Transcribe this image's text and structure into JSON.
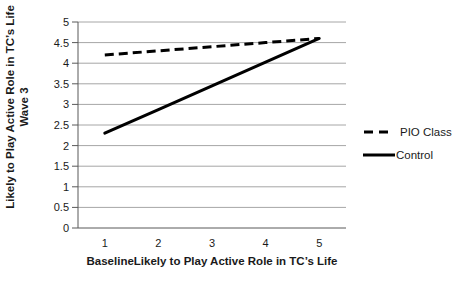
{
  "chart_data": {
    "type": "line",
    "title": "",
    "x": [
      1,
      2,
      3,
      4,
      5
    ],
    "xticks": [
      "1",
      "2",
      "3",
      "4",
      "5"
    ],
    "series": [
      {
        "name": "PIO Class",
        "style": "dashed",
        "color": "#000000",
        "values": [
          4.2,
          4.3,
          4.4,
          4.5,
          4.6
        ]
      },
      {
        "name": "Control",
        "style": "solid",
        "color": "#000000",
        "values": [
          2.3,
          2.875,
          3.45,
          4.025,
          4.6
        ]
      }
    ],
    "xlabel": "BaselineLikely to Play Active Role in TC’s Life",
    "ylabel": "Likely to Play Active Role in TC’s Life Wave 3",
    "ylabel_lines": [
      "Likely to Play Active Role in TC’s Life",
      "Wave 3"
    ],
    "ylim": [
      0,
      5
    ],
    "ytick_step": 0.5,
    "grid": "horizontal",
    "legend_position": "right",
    "colors": {
      "gridline": "#a6a6a6",
      "axis": "#595959",
      "series": "#000000",
      "text": "#1a1a1a",
      "background": "#ffffff"
    }
  }
}
